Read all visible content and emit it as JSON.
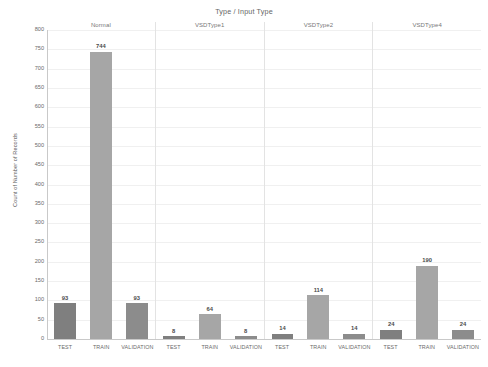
{
  "chart_data": {
    "type": "bar",
    "title": "Type / Input Type",
    "xlabel": "",
    "ylabel": "Count of Number of Records",
    "ylim": [
      0,
      800
    ],
    "grid": true,
    "legend": "none",
    "yticks": [
      800,
      750,
      700,
      650,
      600,
      550,
      500,
      450,
      400,
      350,
      300,
      250,
      200,
      150,
      100,
      50,
      0
    ],
    "panel_label": "Type",
    "panels": [
      "Normal",
      "VSDType1",
      "VSDType2",
      "VSDType4"
    ],
    "categories": [
      "TEST",
      "TRAIN",
      "VALIDATION"
    ],
    "series": [
      {
        "name": "Normal",
        "values": [
          93,
          744,
          93
        ]
      },
      {
        "name": "VSDType1",
        "values": [
          8,
          64,
          8
        ]
      },
      {
        "name": "VSDType2",
        "values": [
          14,
          114,
          14
        ]
      },
      {
        "name": "VSDType4",
        "values": [
          24,
          190,
          24
        ]
      }
    ],
    "colors": {
      "TEST": "#7f7f7f",
      "TRAIN": "#a6a6a6",
      "VALIDATION": "#8c8c8c",
      "gridline": "#f0f0f0",
      "axis": "#c9c9c9",
      "text": "#6a6a6a"
    }
  }
}
